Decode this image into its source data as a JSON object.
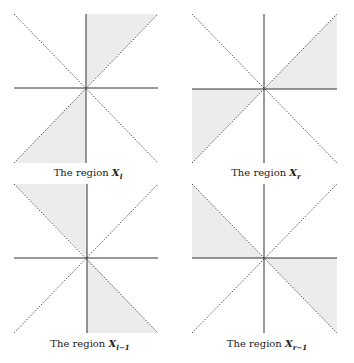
{
  "figure": {
    "fill_color": "#ececec",
    "axis_color": "#333333",
    "diagonal_color": "#555555",
    "panels": [
      {
        "id": "X_l",
        "caption_prefix": "The region ",
        "caption_symbol": "X",
        "caption_subscript": "l",
        "shaded_regions": [
          "between vertical axis and diagonal y=x in upper half (upper-right wedge)",
          "between vertical axis and diagonal y=x in lower half (lower-left wedge)"
        ]
      },
      {
        "id": "X_r",
        "caption_prefix": "The region ",
        "caption_symbol": "X",
        "caption_subscript": "r",
        "shaded_regions": [
          "between horizontal axis and diagonal y=x on right (right-upper wedge)",
          "between horizontal axis and diagonal y=x on left (left-lower wedge)"
        ]
      },
      {
        "id": "X_l-1",
        "caption_prefix": "The region ",
        "caption_symbol": "X",
        "caption_subscript": "l−1",
        "shaded_regions": [
          "between vertical axis and diagonal y=-x in upper half (upper-left wedge)",
          "between vertical axis and diagonal y=-x in lower half (lower-right wedge)"
        ]
      },
      {
        "id": "X_r-1",
        "caption_prefix": "The region ",
        "caption_symbol": "X",
        "caption_subscript": "r−1",
        "shaded_regions": [
          "between horizontal axis and diagonal y=-x on left (left-upper wedge)",
          "between horizontal axis and diagonal y=-x on right (right-lower wedge)"
        ]
      }
    ]
  }
}
